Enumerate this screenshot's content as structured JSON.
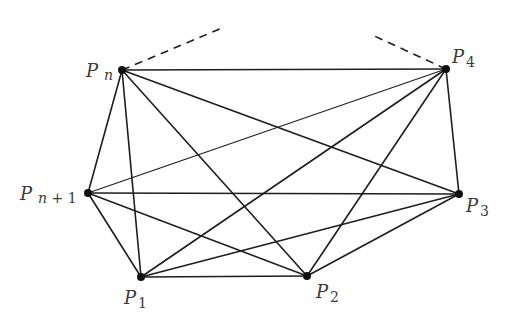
{
  "diagram": {
    "colors": {
      "line": "#1e1e1e",
      "node": "#111111",
      "label": "#3a3a3a",
      "background": "#ffffff"
    },
    "nodes": [
      {
        "id": "Pn",
        "base": "P",
        "sub": "n",
        "x": 122,
        "y": 70,
        "lx": 86,
        "ly": 77,
        "sx": 104,
        "sy": 80
      },
      {
        "id": "P4",
        "base": "P",
        "sub": "4",
        "x": 446,
        "y": 69,
        "lx": 452,
        "ly": 63,
        "sx": 466,
        "sy": 67
      },
      {
        "id": "Pn1",
        "base": "P",
        "sub": "n + 1",
        "x": 88,
        "y": 193,
        "lx": 20,
        "ly": 200,
        "sx": 38,
        "sy": 203
      },
      {
        "id": "P3",
        "base": "P",
        "sub": "3",
        "x": 459,
        "y": 194,
        "lx": 466,
        "ly": 212,
        "sx": 480,
        "sy": 216
      },
      {
        "id": "P1",
        "base": "P",
        "sub": "1",
        "x": 141,
        "y": 277,
        "lx": 124,
        "ly": 304,
        "sx": 138,
        "sy": 308
      },
      {
        "id": "P2",
        "base": "P",
        "sub": "2",
        "x": 307,
        "y": 276,
        "lx": 316,
        "ly": 298,
        "sx": 330,
        "sy": 302
      }
    ],
    "edges": [
      {
        "from": "Pn",
        "to": "P4",
        "weight": 1.6
      },
      {
        "from": "Pn",
        "to": "Pn1",
        "weight": 1.6
      },
      {
        "from": "Pn",
        "to": "P1",
        "weight": 1.6
      },
      {
        "from": "Pn",
        "to": "P2",
        "weight": 1.6
      },
      {
        "from": "Pn",
        "to": "P3",
        "weight": 1.6
      },
      {
        "from": "P4",
        "to": "Pn1",
        "weight": 1.1
      },
      {
        "from": "P4",
        "to": "P1",
        "weight": 1.6
      },
      {
        "from": "P4",
        "to": "P2",
        "weight": 1.6
      },
      {
        "from": "P4",
        "to": "P3",
        "weight": 1.6
      },
      {
        "from": "Pn1",
        "to": "P3",
        "weight": 1.4
      },
      {
        "from": "Pn1",
        "to": "P1",
        "weight": 1.6
      },
      {
        "from": "Pn1",
        "to": "P2",
        "weight": 1.4
      },
      {
        "from": "P3",
        "to": "P1",
        "weight": 1.6
      },
      {
        "from": "P3",
        "to": "P2",
        "weight": 1.6
      },
      {
        "from": "P1",
        "to": "P2",
        "weight": 1.6
      }
    ],
    "dashed_edges": [
      {
        "from": "Pn",
        "x2": 222,
        "y2": 28
      },
      {
        "from": "P4",
        "x2": 370,
        "y2": 34
      }
    ]
  }
}
